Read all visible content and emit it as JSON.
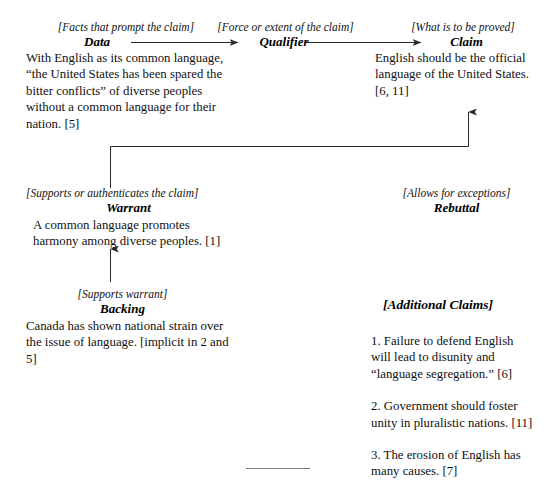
{
  "diagram": {
    "title_model": "Toulmin argument model",
    "nodes": {
      "data": {
        "gloss": "[Facts that prompt the claim]",
        "term": "Data",
        "text": "With English as its common language, “the United States has been spared the bitter conflicts” of diverse peoples without a common language for their nation. [5]"
      },
      "qualifier": {
        "gloss": "[Force or extent of the claim]",
        "term": "Qualifier",
        "text": ""
      },
      "claim": {
        "gloss": "[What is to be proved]",
        "term": "Claim",
        "text": "English should be the official language of the United States. [6, 11]"
      },
      "warrant": {
        "gloss": "[Supports or authenticates the claim]",
        "term": "Warrant",
        "text": "A common language promotes harmony among diverse peoples. [1]"
      },
      "rebuttal": {
        "gloss": "[Allows for exceptions]",
        "term": "Rebuttal",
        "text": ""
      },
      "backing": {
        "gloss": "[Supports warrant]",
        "term": "Backing",
        "text": "Canada has shown national strain over the issue of language. [implicit in 2 and 5]"
      }
    },
    "additional_claims": {
      "heading": "[Additional Claims]",
      "items": [
        "1. Failure to defend English will lead to disunity and “language segregation.” [6]",
        "2. Government should foster unity in pluralistic nations. [11]",
        "3. The erosion of English has many causes. [7]"
      ]
    },
    "connectors": [
      {
        "name": "data-to-qualifier",
        "kind": "arrow-right"
      },
      {
        "name": "qualifier-to-claim",
        "kind": "arrow-right"
      },
      {
        "name": "warrant-to-claim",
        "kind": "elbow-arrow-up"
      },
      {
        "name": "backing-to-warrant",
        "kind": "arrow-up"
      }
    ],
    "colors": {
      "ink": "#111111",
      "line": "#2b2b2b",
      "rule": "#7b7b7b",
      "background": "#ffffff"
    }
  }
}
